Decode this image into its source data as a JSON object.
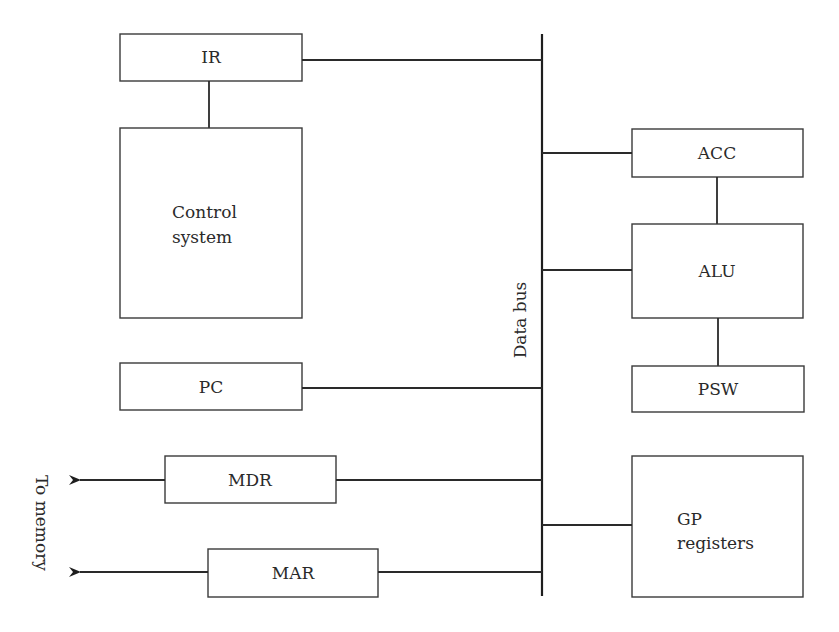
{
  "diagram": {
    "type": "CPU block diagram",
    "bus": {
      "label": "Data bus"
    },
    "external": {
      "label": "To memory"
    },
    "blocks": [
      {
        "id": "ir",
        "label": "IR"
      },
      {
        "id": "control",
        "label_line1": "Control",
        "label_line2": "system"
      },
      {
        "id": "pc",
        "label": "PC"
      },
      {
        "id": "mdr",
        "label": "MDR"
      },
      {
        "id": "mar",
        "label": "MAR"
      },
      {
        "id": "acc",
        "label": "ACC"
      },
      {
        "id": "alu",
        "label": "ALU"
      },
      {
        "id": "psw",
        "label": "PSW"
      },
      {
        "id": "gp",
        "label_line1": "GP",
        "label_line2": "registers"
      }
    ],
    "connections": [
      {
        "from": "IR",
        "to": "Data bus"
      },
      {
        "from": "IR",
        "to": "Control system"
      },
      {
        "from": "PC",
        "to": "Data bus"
      },
      {
        "from": "MDR",
        "to": "Data bus"
      },
      {
        "from": "MDR",
        "to": "To memory",
        "arrow": true
      },
      {
        "from": "MAR",
        "to": "Data bus"
      },
      {
        "from": "MAR",
        "to": "To memory",
        "arrow": true
      },
      {
        "from": "Data bus",
        "to": "ACC"
      },
      {
        "from": "ACC",
        "to": "ALU"
      },
      {
        "from": "Data bus",
        "to": "ALU"
      },
      {
        "from": "ALU",
        "to": "PSW"
      },
      {
        "from": "Data bus",
        "to": "GP registers"
      }
    ]
  }
}
